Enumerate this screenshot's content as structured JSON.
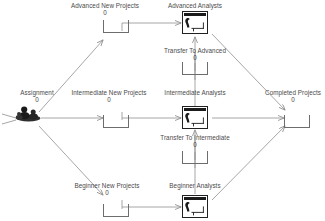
{
  "diagram": {
    "type": "process-flow",
    "colors": {
      "line": "#8f8f8f",
      "queue_stroke": "#6d6d6d",
      "resource_stroke": "#202020",
      "text": "#4a4a4a",
      "background": "#ffffff"
    },
    "nodes": [
      {
        "id": "assignment",
        "kind": "source",
        "label": "Assignment",
        "value": "0",
        "icon": "people-source-icon"
      },
      {
        "id": "advanced-new-projects",
        "kind": "queue",
        "label": "Advanced New Projects",
        "value": "0",
        "icon": "queue-icon"
      },
      {
        "id": "intermediate-new-projects",
        "kind": "queue",
        "label": "Intermediate New Projects",
        "value": "0",
        "icon": "queue-icon"
      },
      {
        "id": "beginner-new-projects",
        "kind": "queue",
        "label": "Beginner New Projects",
        "value": "0",
        "icon": "queue-icon"
      },
      {
        "id": "advanced-analysts",
        "kind": "resource",
        "label": "Advanced Analysts",
        "value": "",
        "icon": "analyst-workstation-icon"
      },
      {
        "id": "intermediate-analysts",
        "kind": "resource",
        "label": "Intermediate Analysts",
        "value": "",
        "icon": "analyst-workstation-icon"
      },
      {
        "id": "beginner-analysts",
        "kind": "resource",
        "label": "Beginner Analysts",
        "value": "",
        "icon": "analyst-workstation-icon"
      },
      {
        "id": "transfer-to-advanced",
        "kind": "queue",
        "label": "Transfer To Advanced",
        "value": "0",
        "icon": "queue-icon"
      },
      {
        "id": "transfer-to-intermediate",
        "kind": "queue",
        "label": "Transfer To Intermediate",
        "value": "0",
        "icon": "queue-icon"
      },
      {
        "id": "completed-projects",
        "kind": "queue",
        "label": "Completed Projects",
        "value": "0",
        "icon": "queue-icon"
      }
    ],
    "edges": [
      {
        "from": "assignment",
        "to": "advanced-new-projects"
      },
      {
        "from": "assignment",
        "to": "intermediate-new-projects"
      },
      {
        "from": "assignment",
        "to": "beginner-new-projects"
      },
      {
        "from": "advanced-new-projects",
        "to": "advanced-analysts"
      },
      {
        "from": "intermediate-new-projects",
        "to": "intermediate-analysts"
      },
      {
        "from": "beginner-new-projects",
        "to": "beginner-analysts"
      },
      {
        "from": "advanced-analysts",
        "to": "completed-projects"
      },
      {
        "from": "intermediate-analysts",
        "to": "completed-projects"
      },
      {
        "from": "beginner-analysts",
        "to": "completed-projects"
      },
      {
        "from": "transfer-to-advanced",
        "to": "advanced-analysts"
      },
      {
        "from": "intermediate-analysts",
        "to": "transfer-to-advanced"
      },
      {
        "from": "transfer-to-intermediate",
        "to": "intermediate-analysts"
      },
      {
        "from": "beginner-analysts",
        "to": "transfer-to-intermediate"
      }
    ]
  }
}
